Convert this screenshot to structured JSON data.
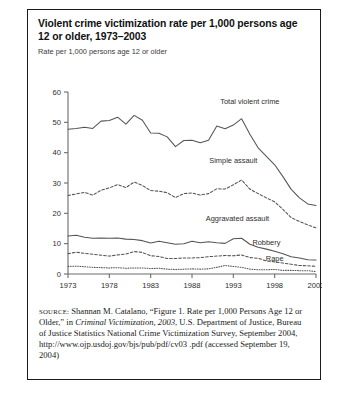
{
  "figure": {
    "title": "Violent crime victimization rate per 1,000 persons age 12 or older, 1973–2003",
    "subtitle": "Rate per 1,000 persons age 12 or older",
    "source_label": "SOURCE:",
    "source_text_1": " Shannan M. Catalano, “Figure 1. Rate per 1,000 Persons Age 12 or Older,” in ",
    "source_italic": "Criminal Victimization, 2003",
    "source_text_2": ", U.S. Department of Justice, Bureau of Justice Statistics National Crime Victimization Survey, September 2004, http://www.ojp.usdoj.gov/bjs/pub/pdf/cv03 .pdf (accessed September 19, 2004)"
  },
  "chart_data": {
    "type": "line",
    "title": "Violent crime victimization rate per 1,000 persons age 12 or older, 1973–2003",
    "xlabel": "",
    "ylabel": "Rate per 1,000 persons age 12 or older",
    "xlim": [
      1973,
      2003
    ],
    "ylim": [
      0,
      60
    ],
    "grid": false,
    "legend_position": "inline-labels",
    "yticks": [
      0,
      10,
      20,
      30,
      40,
      50,
      60
    ],
    "xticks": [
      1973,
      1978,
      1983,
      1988,
      1993,
      1998,
      2003
    ],
    "x": [
      1973,
      1974,
      1975,
      1976,
      1977,
      1978,
      1979,
      1980,
      1981,
      1982,
      1983,
      1984,
      1985,
      1986,
      1987,
      1988,
      1989,
      1990,
      1991,
      1992,
      1993,
      1994,
      1995,
      1996,
      1997,
      1998,
      1999,
      2000,
      2001,
      2002,
      2003
    ],
    "series": [
      {
        "name": "Total violent crime",
        "style": "solid",
        "values": [
          47.7,
          48.0,
          48.4,
          48.0,
          50.4,
          50.6,
          51.7,
          49.4,
          52.3,
          50.7,
          46.5,
          46.4,
          45.2,
          42.0,
          44.0,
          44.1,
          43.3,
          44.1,
          48.8,
          47.9,
          49.1,
          51.2,
          46.1,
          41.6,
          38.8,
          36.0,
          32.1,
          27.9,
          25.1,
          23.1,
          22.6
        ]
      },
      {
        "name": "Simple assault",
        "style": "dashed",
        "values": [
          25.9,
          26.4,
          26.9,
          26.0,
          27.6,
          28.4,
          29.5,
          28.5,
          30.3,
          29.2,
          27.5,
          27.3,
          26.8,
          25.2,
          26.5,
          26.7,
          26.0,
          26.5,
          28.1,
          28.0,
          29.4,
          31.0,
          28.0,
          26.5,
          25.1,
          23.8,
          21.3,
          18.6,
          17.3,
          16.2,
          15.2
        ]
      },
      {
        "name": "Aggravated assault",
        "style": "solid",
        "values": [
          12.5,
          12.8,
          12.1,
          11.8,
          11.9,
          11.8,
          11.9,
          11.5,
          11.4,
          11.0,
          10.2,
          10.8,
          10.3,
          9.8,
          10.0,
          10.8,
          10.3,
          10.6,
          10.3,
          10.1,
          11.6,
          11.8,
          9.8,
          8.8,
          8.2,
          7.5,
          6.7,
          5.7,
          5.3,
          4.7,
          4.6
        ]
      },
      {
        "name": "Robbery",
        "style": "dashed",
        "values": [
          6.7,
          7.2,
          6.8,
          6.5,
          6.2,
          5.9,
          6.3,
          6.6,
          7.4,
          7.1,
          6.0,
          5.8,
          5.1,
          5.1,
          5.3,
          5.3,
          5.4,
          5.7,
          5.9,
          6.1,
          6.0,
          6.3,
          5.4,
          5.2,
          4.3,
          4.0,
          3.6,
          3.2,
          2.8,
          2.7,
          2.5
        ]
      },
      {
        "name": "Rape",
        "style": "dotted",
        "values": [
          2.5,
          2.6,
          2.4,
          2.2,
          2.1,
          2.0,
          2.1,
          1.9,
          2.0,
          2.0,
          1.8,
          1.9,
          1.6,
          1.5,
          1.6,
          1.7,
          1.6,
          1.7,
          2.2,
          2.8,
          2.5,
          2.2,
          1.6,
          1.4,
          1.4,
          1.5,
          1.2,
          1.2,
          1.1,
          1.1,
          0.8
        ]
      }
    ],
    "annotations": [
      {
        "text": "Total violent crime",
        "x": 1995.0,
        "y": 56.0
      },
      {
        "text": "Simple assault",
        "x": 1993.0,
        "y": 36.5
      },
      {
        "text": "Aggravated assault",
        "x": 1993.5,
        "y": 17.5
      },
      {
        "text": "Robbery",
        "x": 1997.0,
        "y": 9.5
      },
      {
        "text": "Rape",
        "x": 1998.0,
        "y": 4.3
      }
    ]
  }
}
